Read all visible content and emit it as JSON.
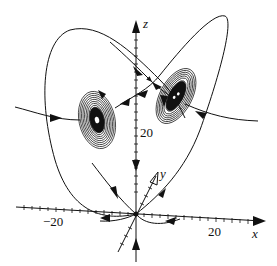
{
  "figure": {
    "type": "3D phase portrait (Lorenz-type attractor with two spiral foci)",
    "axes": {
      "x": {
        "label": "x",
        "tick_label": "20",
        "neg_tick_label": "−20"
      },
      "y": {
        "label": "y"
      },
      "z": {
        "label": "z",
        "tick_label": "20"
      }
    },
    "equilibria": [
      {
        "name": "origin",
        "kind": "saddle"
      },
      {
        "name": "left-focus",
        "kind": "spiral"
      },
      {
        "name": "right-focus",
        "kind": "spiral"
      }
    ],
    "colors": {
      "stroke": "#111111",
      "background": "#ffffff"
    }
  }
}
